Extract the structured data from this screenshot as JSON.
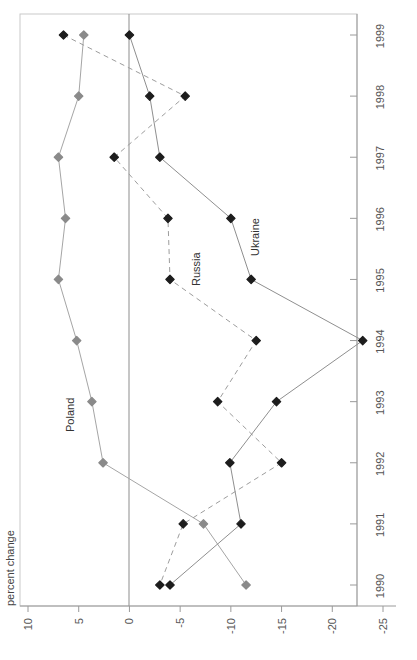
{
  "chart_data": {
    "type": "line",
    "title": "",
    "subtitle": "",
    "orientation": "horizontal-value-vertical-category",
    "xlabel": "percent change",
    "ylabel": "",
    "xlim": [
      10,
      -25
    ],
    "xticks": [
      10,
      5,
      0,
      -5,
      -10,
      -15,
      -20,
      -25
    ],
    "xtick_labels": [
      "10",
      "5",
      "0",
      "-5",
      "-10",
      "-15",
      "-20",
      "-25"
    ],
    "categories": [
      1999,
      1998,
      1997,
      1996,
      1995,
      1994,
      1993,
      1992,
      1991,
      1990
    ],
    "ytick_labels": [
      "1999",
      "1998",
      "1997",
      "1996",
      "1995",
      "1994",
      "1993",
      "1992",
      "1991",
      "1990"
    ],
    "grid": false,
    "legend": "inline-annotations",
    "zero_reference_line": 0,
    "series": [
      {
        "name": "Poland",
        "color": "#8a8a8a",
        "line_style": "solid-light",
        "marker": "diamond",
        "values": [
          4.5,
          5.0,
          7.0,
          6.3,
          7.0,
          5.2,
          3.7,
          2.6,
          -7.3,
          -11.5
        ]
      },
      {
        "name": "Russia",
        "color": "#1d1d1d",
        "line_style": "dashed",
        "marker": "diamond",
        "values": [
          6.5,
          -5.5,
          1.5,
          -3.8,
          -4.0,
          -12.5,
          -8.7,
          -15.0,
          -5.3,
          -3.0
        ]
      },
      {
        "name": "Ukraine",
        "color": "#1d1d1d",
        "line_style": "solid",
        "marker": "diamond",
        "values": [
          0.0,
          -2.0,
          -3.0,
          -10.0,
          -12.0,
          -23.0,
          -14.5,
          -9.9,
          -11.0,
          -4.0
        ]
      }
    ],
    "annotations": [
      {
        "text": "Poland",
        "series": "Poland",
        "near_year": 1993
      },
      {
        "text": "Russia",
        "series": "Russia",
        "near_year": 1995
      },
      {
        "text": "Ukraine",
        "series": "Ukraine",
        "near_year": 1996
      }
    ]
  },
  "axis": {
    "percent_change_label": "percent change"
  }
}
